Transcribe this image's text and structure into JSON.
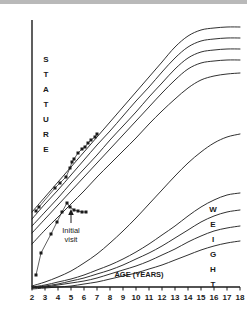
{
  "figure": {
    "name": "growth-chart",
    "background_color": "#ffffff",
    "ink_color": "#1a1a1a",
    "top_band_color": "#b9b9b9"
  },
  "axes": {
    "x_title": "AGE (YEARS)",
    "x_ticks": [
      "2",
      "3",
      "4",
      "5",
      "6",
      "7",
      "8",
      "9",
      "10",
      "11",
      "12",
      "13",
      "14",
      "15",
      "16",
      "17",
      "18"
    ],
    "x_min": 2,
    "x_max": 18,
    "left_label_text": "STATURE",
    "left_label_letters": [
      "S",
      "T",
      "A",
      "T",
      "U",
      "R",
      "E"
    ],
    "right_label_text": "WEIGHT",
    "right_label_letters": [
      "W",
      "E",
      "I",
      "G",
      "H",
      "T"
    ]
  },
  "annotations": [
    {
      "name": "initial-visit",
      "line1": "Initial",
      "line2": "visit",
      "arrow": "up-arrow"
    }
  ],
  "chart_data": {
    "type": "line",
    "title": "",
    "subtitle": "",
    "xlabel": "AGE (YEARS)",
    "ylabel": "STATURE",
    "ylabel_right": "WEIGHT",
    "xlim": [
      2,
      18
    ],
    "grid": false,
    "legend": "none",
    "annotations": [
      {
        "text": "Initial visit",
        "x": 4.7,
        "note": "arrow points to stature plot peak at initial visit"
      }
    ],
    "series": [
      {
        "name": "stature-percentile-95",
        "group": "stature",
        "kind": "reference-curve",
        "x": [
          2,
          3,
          4,
          5,
          6,
          7,
          8,
          9,
          10,
          11,
          12,
          13,
          14,
          15,
          16,
          17,
          18
        ],
        "y_px": [
          212,
          197,
          182,
          167,
          152,
          137,
          122,
          107,
          92,
          77,
          62,
          47,
          36,
          30,
          28,
          27,
          27
        ]
      },
      {
        "name": "stature-percentile-75",
        "group": "stature",
        "kind": "reference-curve",
        "x": [
          2,
          3,
          4,
          5,
          6,
          7,
          8,
          9,
          10,
          11,
          12,
          13,
          14,
          15,
          16,
          17,
          18
        ],
        "y_px": [
          219,
          204,
          190,
          175,
          160,
          145,
          131,
          116,
          101,
          87,
          72,
          58,
          47,
          41,
          39,
          38,
          38
        ]
      },
      {
        "name": "stature-percentile-50",
        "group": "stature",
        "kind": "reference-curve",
        "x": [
          2,
          3,
          4,
          5,
          6,
          7,
          8,
          9,
          10,
          11,
          12,
          13,
          14,
          15,
          16,
          17,
          18
        ],
        "y_px": [
          226,
          212,
          198,
          183,
          169,
          155,
          140,
          126,
          112,
          97,
          83,
          69,
          58,
          52,
          50,
          49,
          49
        ]
      },
      {
        "name": "stature-percentile-25",
        "group": "stature",
        "kind": "reference-curve",
        "x": [
          2,
          3,
          4,
          5,
          6,
          7,
          8,
          9,
          10,
          11,
          12,
          13,
          14,
          15,
          16,
          17,
          18
        ],
        "y_px": [
          233,
          219,
          205,
          191,
          177,
          163,
          149,
          135,
          121,
          107,
          93,
          80,
          69,
          63,
          61,
          60,
          60
        ]
      },
      {
        "name": "stature-percentile-5",
        "group": "stature",
        "kind": "reference-curve",
        "x": [
          2,
          3,
          4,
          5,
          6,
          7,
          8,
          9,
          10,
          11,
          12,
          13,
          14,
          15,
          16,
          17,
          18
        ],
        "y_px": [
          244,
          230,
          217,
          204,
          191,
          177,
          164,
          151,
          138,
          124,
          111,
          99,
          88,
          80,
          76,
          74,
          73
        ]
      },
      {
        "name": "weight-percentile-95",
        "group": "weight",
        "kind": "reference-curve",
        "x": [
          2,
          3,
          4,
          5,
          6,
          7,
          8,
          9,
          10,
          11,
          12,
          13,
          14,
          15,
          16,
          17,
          18
        ],
        "y_px": [
          286,
          282,
          277,
          271,
          263,
          254,
          243,
          231,
          218,
          204,
          190,
          176,
          163,
          152,
          143,
          137,
          134
        ]
      },
      {
        "name": "weight-percentile-75",
        "group": "weight",
        "kind": "reference-curve",
        "x": [
          2,
          3,
          4,
          5,
          6,
          7,
          8,
          9,
          10,
          11,
          12,
          13,
          14,
          15,
          16,
          17,
          18
        ],
        "y_px": [
          287,
          285,
          282,
          279,
          275,
          270,
          265,
          259,
          252,
          244,
          235,
          226,
          216,
          207,
          200,
          195,
          193
        ]
      },
      {
        "name": "weight-percentile-50",
        "group": "weight",
        "kind": "reference-curve",
        "x": [
          2,
          3,
          4,
          5,
          6,
          7,
          8,
          9,
          10,
          11,
          12,
          13,
          14,
          15,
          16,
          17,
          18
        ],
        "y_px": [
          288,
          286,
          284,
          281,
          278,
          274,
          270,
          265,
          259,
          253,
          246,
          238,
          230,
          222,
          216,
          212,
          210
        ]
      },
      {
        "name": "weight-percentile-25",
        "group": "weight",
        "kind": "reference-curve",
        "x": [
          2,
          3,
          4,
          5,
          6,
          7,
          8,
          9,
          10,
          11,
          12,
          13,
          14,
          15,
          16,
          17,
          18
        ],
        "y_px": [
          288,
          287,
          285,
          283,
          281,
          278,
          274,
          270,
          266,
          261,
          255,
          249,
          242,
          236,
          231,
          228,
          226
        ]
      },
      {
        "name": "weight-percentile-5",
        "group": "weight",
        "kind": "reference-curve",
        "x": [
          2,
          3,
          4,
          5,
          6,
          7,
          8,
          9,
          10,
          11,
          12,
          13,
          14,
          15,
          16,
          17,
          18
        ],
        "y_px": [
          289,
          288,
          287,
          286,
          284,
          282,
          279,
          276,
          273,
          269,
          265,
          260,
          255,
          250,
          246,
          243,
          241
        ]
      },
      {
        "name": "patient-stature",
        "group": "stature",
        "kind": "patient-measurements",
        "marker": "filled-square",
        "points_px": [
          [
            36,
            211
          ],
          [
            39,
            207
          ],
          [
            55,
            188
          ],
          [
            60,
            183
          ],
          [
            66,
            177
          ],
          [
            70,
            168
          ],
          [
            72,
            162
          ],
          [
            74,
            159
          ],
          [
            78,
            153
          ],
          [
            82,
            149
          ],
          [
            85,
            147
          ],
          [
            88,
            143
          ],
          [
            91,
            140
          ],
          [
            95,
            137
          ],
          [
            97,
            134
          ]
        ]
      },
      {
        "name": "patient-weight",
        "group": "weight",
        "kind": "patient-measurements",
        "marker": "filled-square",
        "points_px": [
          [
            36,
            275
          ],
          [
            41,
            253
          ],
          [
            51,
            234
          ],
          [
            57,
            222
          ],
          [
            62,
            212
          ],
          [
            67,
            203
          ],
          [
            70,
            207
          ],
          [
            74,
            210
          ],
          [
            78,
            211
          ],
          [
            82,
            212
          ],
          [
            86,
            212
          ]
        ]
      }
    ]
  }
}
